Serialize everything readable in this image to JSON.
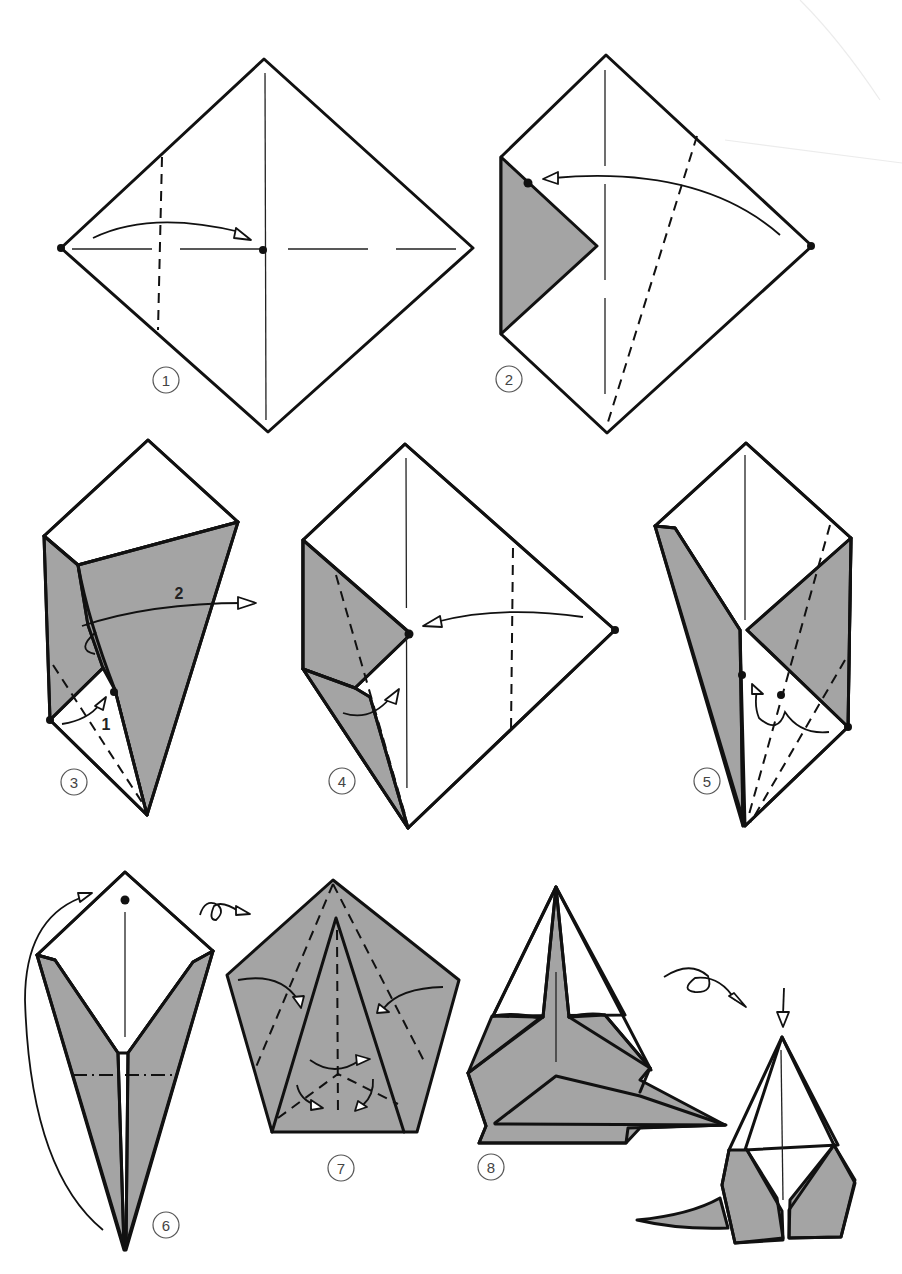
{
  "diagram": {
    "type": "origami-instructions",
    "palette": {
      "paper_front": "#ffffff",
      "paper_back": "#a4a4a4",
      "line": "#111111",
      "step_number": "#444444"
    },
    "steps": [
      {
        "number": "1",
        "description": "Square diamond with center creases; fold left corner to center dot along valley line"
      },
      {
        "number": "2",
        "description": "Left corner folded in (gray); fold right corner to marked dot along diagonal valley line"
      },
      {
        "number": "3",
        "description": "Kite shape, sub-steps labeled",
        "sub_labels": [
          "1",
          "2"
        ]
      },
      {
        "number": "4",
        "description": "Fold right corner to center dot; open lower left flap"
      },
      {
        "number": "5",
        "description": "Squash lower flap up to dot"
      },
      {
        "number": "6",
        "description": "Mountain fold along dash-dot line; turn over"
      },
      {
        "number": "7",
        "description": "Pentagon shape; fold sides in along valley lines"
      },
      {
        "number": "8",
        "description": "Shape with tail; turn over to finished model"
      }
    ],
    "symbols": {
      "turn_over": "turn-over-icon",
      "push_down": "push-arrow-icon",
      "valley_fold": "dashed-line",
      "mountain_fold": "dash-dot-line",
      "reference_point": "dot"
    }
  }
}
